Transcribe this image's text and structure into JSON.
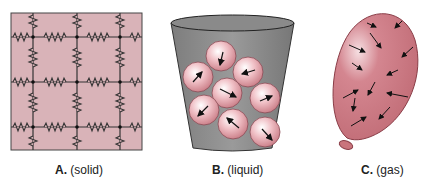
{
  "panels": [
    {
      "letter": "A.",
      "state": "(solid)"
    },
    {
      "letter": "B.",
      "state": "(liquid)"
    },
    {
      "letter": "C.",
      "state": "(gas)"
    }
  ],
  "colors": {
    "solid_bg": "#d9b3b8",
    "cup": "#8f8f8f",
    "particle": "#e8a9b0",
    "balloon": "#c9747c"
  }
}
